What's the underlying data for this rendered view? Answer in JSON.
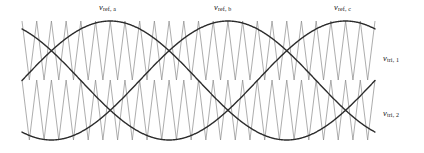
{
  "figure": {
    "name": "pwm-carrier-reference-waveforms",
    "background": "#ffffff",
    "width": 424,
    "height": 153
  },
  "labels": {
    "ref_a": {
      "var": "v",
      "sub": "ref, a"
    },
    "ref_b": {
      "var": "v",
      "sub": "ref, b"
    },
    "ref_c": {
      "var": "v",
      "sub": "ref, c"
    },
    "tri_1": {
      "var": "v",
      "sub": "tri, 1"
    },
    "tri_2": {
      "var": "v",
      "sub": "tri, 2"
    }
  },
  "colors": {
    "reference_line": "#2b2b2b",
    "carrier_line": "#8a8a8a",
    "text": "#141414",
    "background": "#ffffff"
  },
  "chart_data": {
    "type": "line",
    "title": "",
    "xlabel": "",
    "ylabel": "",
    "grid": false,
    "legend": "inline-annotations",
    "plot_area": {
      "x0": 22,
      "x1": 375,
      "y_top": 21,
      "y_bottom": 140
    },
    "xlim": [
      0,
      360
    ],
    "ylim": [
      -1,
      1
    ],
    "x_unit": "degrees",
    "carriers": [
      {
        "name": "v_tri,1",
        "label": "v_tri, 1",
        "waveform": "triangle",
        "role": "upper carrier",
        "band": [
          0,
          1
        ],
        "y_pixel_range": [
          21,
          80
        ],
        "cycles": 24,
        "period_px": 14.7,
        "color": "#8a8a8a",
        "line_width": 0.7
      },
      {
        "name": "v_tri,2",
        "label": "v_tri, 2",
        "waveform": "triangle",
        "role": "lower carrier",
        "band": [
          -1,
          0
        ],
        "y_pixel_range": [
          80,
          140
        ],
        "cycles": 24,
        "period_px": 14.7,
        "color": "#8a8a8a",
        "line_width": 0.7
      }
    ],
    "references": [
      {
        "name": "v_ref,a",
        "label": "v_ref, a",
        "waveform": "sine",
        "amplitude": 1.0,
        "phase_deg": 120,
        "peak_x_deg": 90,
        "peak_x_px": 110,
        "cycles": 1,
        "color": "#2b2b2b",
        "line_width": 1.4
      },
      {
        "name": "v_ref,b",
        "label": "v_ref, b",
        "waveform": "sine",
        "amplitude": 1.0,
        "phase_deg": 0,
        "peak_x_deg": 210,
        "peak_x_px": 228,
        "cycles": 1,
        "color": "#2b2b2b",
        "line_width": 1.4
      },
      {
        "name": "v_ref,c",
        "label": "v_ref, c",
        "waveform": "sine",
        "amplitude": 1.0,
        "phase_deg": 240,
        "peak_x_deg": 330,
        "peak_x_px": 348,
        "cycles": 1,
        "color": "#2b2b2b",
        "line_width": 1.4
      }
    ]
  }
}
